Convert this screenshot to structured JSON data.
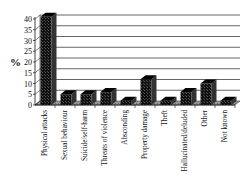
{
  "chart_data": {
    "type": "bar",
    "style": "3d-column",
    "title": "",
    "xlabel": "",
    "ylabel": "%",
    "ylim": [
      0,
      40
    ],
    "yticks": [
      0,
      5,
      10,
      15,
      20,
      25,
      30,
      35,
      40
    ],
    "grid": true,
    "legend": null,
    "categories": [
      "Physical attacks",
      "Sexual behaviour",
      "Suicide/self-harm",
      "Threats of violence",
      "Absconding",
      "Property damage",
      "Theft",
      "Hallucinated/deluded",
      "Other",
      "Not known"
    ],
    "values": [
      41,
      5,
      5,
      6,
      2,
      12,
      2,
      6,
      10,
      2
    ],
    "colors": {
      "bar": "#111111",
      "bar_side": "#333333",
      "floor": "#9a9a9a",
      "grid": "#222222"
    }
  }
}
